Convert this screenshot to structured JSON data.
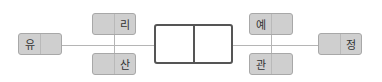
{
  "diagram": {
    "nodes": [
      {
        "id": "left",
        "label": "유",
        "label_side": "left"
      },
      {
        "id": "top-left",
        "label": "리",
        "label_side": "right"
      },
      {
        "id": "bottom-left",
        "label": "산",
        "label_side": "right"
      },
      {
        "id": "top-right",
        "label": "예",
        "label_side": "left"
      },
      {
        "id": "bottom-right",
        "label": "관",
        "label_side": "left"
      },
      {
        "id": "right",
        "label": "정",
        "label_side": "right"
      }
    ],
    "center_box": {
      "cells": [
        "",
        ""
      ]
    },
    "colors": {
      "box_fill": "#cfcfcf",
      "box_border": "#a8a8a8",
      "line": "#b5b5b5",
      "center_border": "#555555"
    }
  }
}
